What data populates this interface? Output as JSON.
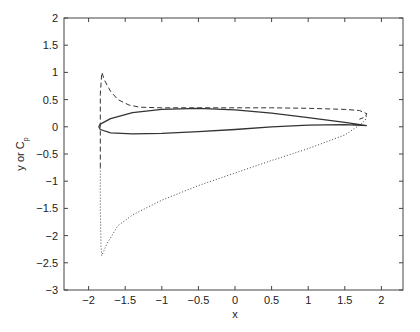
{
  "chart_data": {
    "type": "line",
    "title": "",
    "xlabel": "x",
    "ylabel": "y or C",
    "ylabel_subscript": "p",
    "xlim": [
      -2.35,
      2.3
    ],
    "ylim": [
      -3,
      2
    ],
    "grid": false,
    "legend": null,
    "x_ticks": [
      -2,
      -1.5,
      -1,
      -0.5,
      0,
      0.5,
      1,
      1.5,
      2
    ],
    "x_tick_labels": [
      "−2",
      "−1.5",
      "−1",
      "−0.5",
      "0",
      "0.5",
      "1",
      "1.5",
      "2"
    ],
    "y_ticks": [
      2,
      1.5,
      1,
      0.5,
      0,
      -0.5,
      -1,
      -1.5,
      -2,
      -2.5,
      -3
    ],
    "y_tick_labels": [
      "2",
      "1.5",
      "1",
      "0.5",
      "0",
      "−0.5",
      "−1",
      "−1.5",
      "−2",
      "−2.5",
      "−3"
    ],
    "series": [
      {
        "name": "airfoil surface",
        "style": "solid",
        "color": "#333333",
        "x": [
          1.8,
          1.5,
          1.0,
          0.5,
          0.0,
          -0.5,
          -1.0,
          -1.4,
          -1.7,
          -1.84,
          -1.86,
          -1.84,
          -1.7,
          -1.4,
          -1.0,
          -0.5,
          0.0,
          0.5,
          1.0,
          1.5,
          1.8
        ],
        "y": [
          0.02,
          0.08,
          0.17,
          0.25,
          0.31,
          0.34,
          0.32,
          0.26,
          0.15,
          0.05,
          0.0,
          -0.05,
          -0.11,
          -0.13,
          -0.12,
          -0.09,
          -0.05,
          0.0,
          0.03,
          0.04,
          0.02
        ]
      },
      {
        "name": "Cp upper (dashed)",
        "style": "dashed",
        "color": "#333333",
        "x": [
          -1.84,
          -1.84,
          -1.84,
          -1.82,
          -1.78,
          -1.7,
          -1.6,
          -1.45,
          -1.3,
          -1.0,
          -0.5,
          0.0,
          0.5,
          1.0,
          1.5,
          1.7,
          1.8,
          1.78,
          1.7
        ],
        "y": [
          -0.75,
          0.0,
          0.6,
          1.0,
          0.85,
          0.65,
          0.5,
          0.4,
          0.36,
          0.35,
          0.35,
          0.35,
          0.35,
          0.34,
          0.32,
          0.3,
          0.24,
          0.18,
          0.14
        ]
      },
      {
        "name": "Cp lower (dotted)",
        "style": "dotted",
        "color": "#444444",
        "x": [
          -1.84,
          -1.84,
          -1.83,
          -1.82,
          -1.75,
          -1.6,
          -1.4,
          -1.0,
          -0.5,
          0.0,
          0.5,
          1.0,
          1.5,
          1.7,
          1.78,
          1.8
        ],
        "y": [
          -0.75,
          -1.5,
          -2.2,
          -2.37,
          -2.15,
          -1.82,
          -1.62,
          -1.35,
          -1.08,
          -0.85,
          -0.62,
          -0.4,
          -0.15,
          0.03,
          0.12,
          0.22
        ]
      }
    ]
  }
}
